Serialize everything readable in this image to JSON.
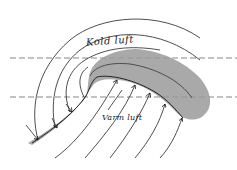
{
  "diagram": {
    "type": "weather-front-diagram",
    "labels": {
      "cold_air": "Kold luft",
      "warm_air": "Varm luft"
    },
    "elements": {
      "frontal_zone": "shaded curved band (frontal cloud zone)",
      "isolines": "curved streamlines converging on front",
      "arrows": "flow arrows pointing to front boundary",
      "reference_lines": "two horizontal dashed lines"
    },
    "colors": {
      "line": "#222222",
      "shading": "#9a9a9a",
      "background": "#ffffff"
    }
  }
}
